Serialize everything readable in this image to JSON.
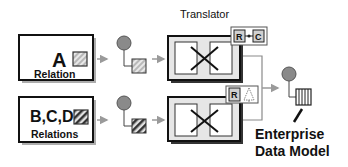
{
  "diagram": {
    "translator_label": "Translator",
    "source_a": {
      "letter": "A",
      "sublabel": "Relation",
      "pattern": "light-diagonal-hatch"
    },
    "source_bcd": {
      "letter": "B,C,D",
      "sublabel": "Relations",
      "pattern": "dark-diagonal-hatch"
    },
    "translator_top_badge": {
      "left": "R",
      "right": "C",
      "connector": "line-with-dot"
    },
    "translator_bottom_badge": {
      "left": "R",
      "right_icon": "tree-icon"
    },
    "target": {
      "line1": "Enterprise",
      "line2": "Data Model",
      "pattern": "vertical-bars"
    },
    "colors": {
      "node_circle": "#8a8a8a",
      "arrow": "#9a9a9a",
      "box_border": "#111111",
      "translator_fill": "#e6e6e6",
      "shadow": "#888888"
    }
  }
}
